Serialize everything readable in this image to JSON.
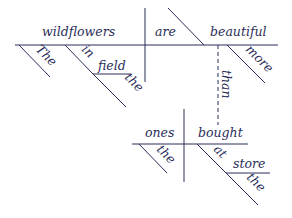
{
  "diagram": {
    "type": "sentence-diagram",
    "color": "#2b2e5a",
    "words": {
      "subject": "wildflowers",
      "verb": "are",
      "predicate": "beautiful",
      "subject_article": "The",
      "preposition_1": "in",
      "prep_object_1": "field",
      "prep_object_1_article": "the",
      "adverb": "more",
      "conjunction": "than",
      "sub_subject": "ones",
      "sub_verb": "bought",
      "sub_subject_article": "the",
      "preposition_2": "at",
      "prep_object_2": "store",
      "prep_object_2_article": "the"
    }
  }
}
